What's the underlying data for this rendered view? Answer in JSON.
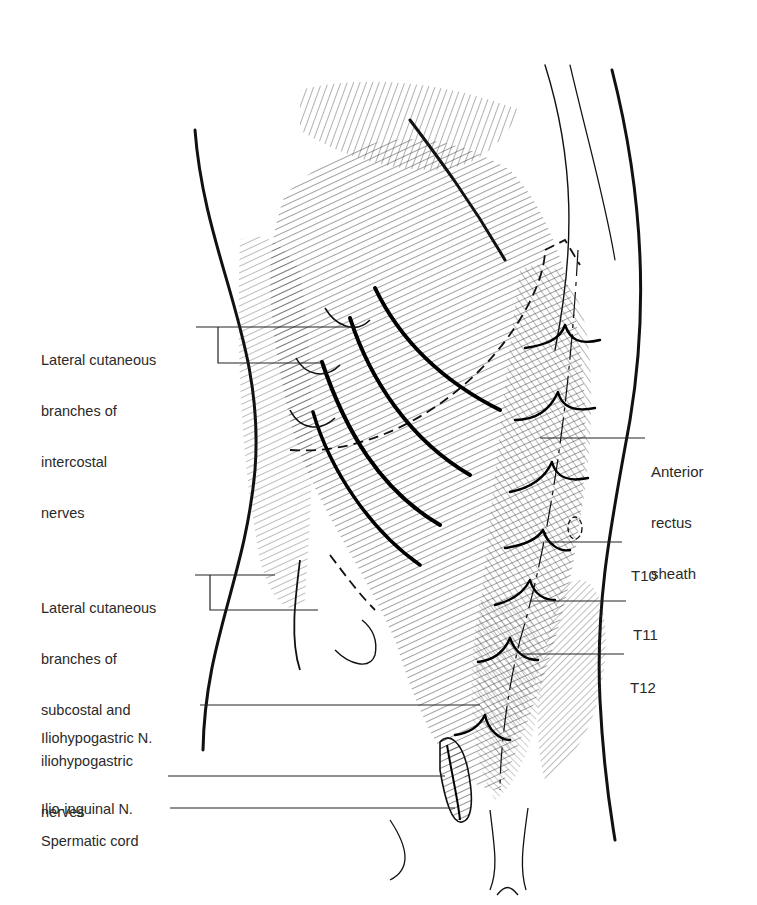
{
  "diagram": {
    "background": "#ffffff",
    "line_color": "#111111",
    "label_color": "#2a2a2a"
  },
  "labels_left": [
    {
      "id": "lat-cut-intercostal",
      "lines": [
        "Lateral cutaneous",
        "branches of",
        "intercostal",
        "nerves"
      ]
    },
    {
      "id": "lat-cut-subcostal",
      "lines": [
        "Lateral cutaneous",
        "branches of",
        "subcostal and",
        "iliohypogastric",
        "nerves"
      ]
    },
    {
      "id": "iliohypogastric",
      "lines": [
        "Iliohypogastric N."
      ]
    },
    {
      "id": "ilio-inguinal",
      "lines": [
        "Ilio-inguinal N."
      ]
    },
    {
      "id": "spermatic-cord",
      "lines": [
        "Spermatic cord"
      ]
    }
  ],
  "labels_right": [
    {
      "id": "anterior-rectus-sheath",
      "lines": [
        "Anterior",
        "rectus",
        "sheath"
      ]
    },
    {
      "id": "t10",
      "lines": [
        "T10"
      ]
    },
    {
      "id": "t11",
      "lines": [
        "T11"
      ]
    },
    {
      "id": "t12",
      "lines": [
        "T12"
      ]
    }
  ]
}
